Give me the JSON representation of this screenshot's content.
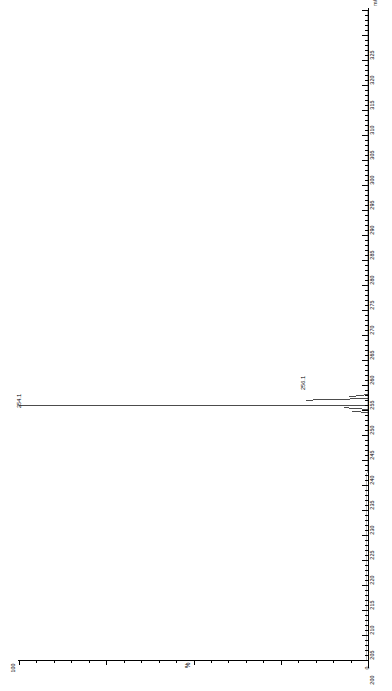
{
  "chart_data": {
    "type": "bar",
    "title": "",
    "subtitle": "",
    "orientation": "rotated-90",
    "xlabel": "m/z",
    "ylabel": "%",
    "xlim": [
      200,
      330
    ],
    "ylim": [
      0,
      100
    ],
    "grid": false,
    "legend": null,
    "x_major_step": 5,
    "x_ticks": [
      200,
      205,
      210,
      215,
      220,
      225,
      230,
      235,
      240,
      245,
      250,
      255,
      260,
      265,
      270,
      275,
      280,
      285,
      290,
      295,
      300,
      305,
      310,
      315,
      320,
      325
    ],
    "x_tick_labels": [
      "200",
      "205",
      "210",
      "215",
      "220",
      "225",
      "230",
      "235",
      "240",
      "245",
      "250",
      "255",
      "260",
      "265",
      "270",
      "275",
      "280",
      "285",
      "290",
      "295",
      "300",
      "305",
      "310",
      "315",
      "320",
      "325"
    ],
    "y_ticks": [
      0,
      100
    ],
    "y_tick_labels": [
      "0",
      "100"
    ],
    "mz": [
      254.1,
      256.1
    ],
    "intensity": [
      100,
      34
    ],
    "peaks": [
      {
        "mz": 254.1,
        "label": "254.1",
        "intensity": 100
      },
      {
        "mz": 256.1,
        "label": "256.1",
        "intensity": 34
      }
    ],
    "baseline_intensity": 0,
    "annotations": [
      "254.1",
      "256.1"
    ]
  },
  "axes": {
    "mz_axis_title": "m/z",
    "pct_axis_title": "%",
    "pct_max_label": "100",
    "pct_min_label": "0"
  }
}
